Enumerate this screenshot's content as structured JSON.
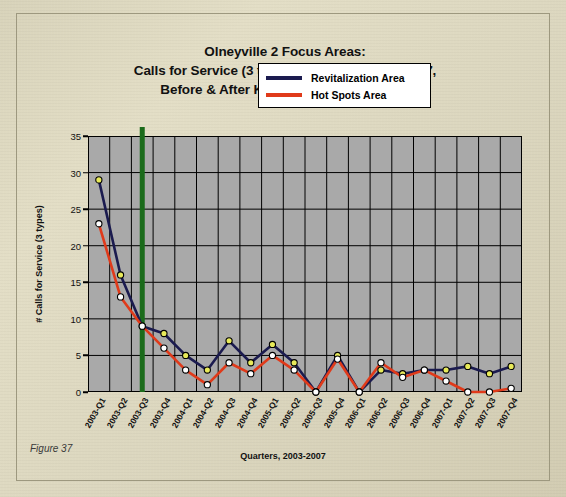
{
  "figure": {
    "caption": "Figure 37"
  },
  "chart_data": {
    "type": "line",
    "title": "Olneyville 2 Focus Areas:\nCalls for Service (3 types), Quarterly, 2003-2007,\nBefore & After Key Interventions Began",
    "title_lines": [
      "Olneyville 2 Focus Areas:",
      "Calls for Service (3 types), Quarterly, 2003-2007,",
      "Before & After Key Interventions Began"
    ],
    "xlabel": "Quarters, 2003-2007",
    "ylabel": "# Calls for Service (3 types)",
    "ylim": [
      0,
      35
    ],
    "yticks": [
      0,
      5,
      10,
      15,
      20,
      25,
      30,
      35
    ],
    "grid": true,
    "legend_position": "upper-right-inside",
    "plot_background": "#a9a9a9",
    "categories": [
      "2003-Q1",
      "2003-Q2",
      "2003-Q3",
      "2003-Q4",
      "2004-Q1",
      "2004-Q2",
      "2004-Q3",
      "2004-Q4",
      "2005-Q1",
      "2005-Q2",
      "2005-Q3",
      "2005-Q4",
      "2006-Q1",
      "2006-Q2",
      "2006-Q3",
      "2006-Q4",
      "2007-Q1",
      "2007-Q2",
      "2007-Q3",
      "2007-Q4"
    ],
    "series": [
      {
        "name": "Revitalization Area",
        "color": "#1b1b4f",
        "marker_fill": "#e8ea5a",
        "marker_edge": "#000000",
        "values": [
          29,
          16,
          9,
          8,
          5,
          3,
          7,
          4,
          6.5,
          4,
          0,
          5,
          0,
          3,
          2.5,
          3,
          3,
          3.5,
          2.5,
          3.5
        ]
      },
      {
        "name": "Hot Spots Area",
        "color": "#e03a1a",
        "marker_fill": "#ffffff",
        "marker_edge": "#000000",
        "values": [
          23,
          13,
          9,
          6,
          3,
          1,
          4,
          2.5,
          5,
          3,
          0,
          4.5,
          0,
          4,
          2,
          3,
          1.5,
          0,
          0,
          0.5
        ]
      }
    ],
    "annotations": [
      {
        "type": "vertical-line",
        "name": "intervention-marker",
        "at_category": "2003-Q3",
        "color": "#1b6b1b",
        "width_px": 5
      }
    ]
  },
  "legend": {
    "items": [
      {
        "label": "Revitalization Area",
        "color": "#1b1b4f"
      },
      {
        "label": "Hot Spots Area",
        "color": "#e03a1a"
      }
    ]
  }
}
